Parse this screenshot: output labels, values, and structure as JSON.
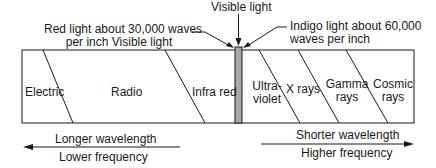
{
  "annotations": {
    "visible_light": "Visible light",
    "red_light_line1": "Red light about 30,000 waves",
    "red_light_line2": "per inch Visible light",
    "indigo_light_line1": "Indigo light about 60,000",
    "indigo_light_line2": "waves per inch"
  },
  "bands": [
    {
      "id": "electric",
      "line1": "Electric",
      "line2": ""
    },
    {
      "id": "radio",
      "line1": "Radio",
      "line2": ""
    },
    {
      "id": "infrared",
      "line1": "Infra red",
      "line2": ""
    },
    {
      "id": "ultraviolet",
      "line1": "Ultra-",
      "line2": "violet"
    },
    {
      "id": "xrays",
      "line1": "X rays",
      "line2": ""
    },
    {
      "id": "gamma",
      "line1": "Gamma",
      "line2": "rays"
    },
    {
      "id": "cosmic",
      "line1": "Cosmic",
      "line2": "rays"
    }
  ],
  "left_arrow": {
    "top": "Longer wavelength",
    "bottom": "Lower frequency"
  },
  "right_arrow": {
    "top": "Shorter wavelength",
    "bottom": "Higher frequency"
  },
  "colors": {
    "line": "#1a1a1a",
    "visible_strip": "#a9a9a9"
  }
}
